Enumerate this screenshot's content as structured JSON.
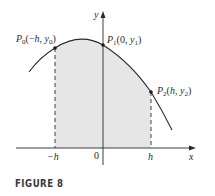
{
  "figure": {
    "caption": "FIGURE 8",
    "axes": {
      "x_label": "x",
      "y_label": "y",
      "origin_label": "0",
      "x_ticks": [
        "−h",
        "h"
      ]
    },
    "points": [
      {
        "name": "P0",
        "main": "P",
        "sub": "0",
        "coords_open": "(−",
        "h": "h",
        "comma": ", ",
        "yvar": "y",
        "ysub": "0",
        "close": ")"
      },
      {
        "name": "P1",
        "main": "P",
        "sub": "1",
        "coords_open": "(0, ",
        "yvar": "y",
        "ysub": "1",
        "close": ")"
      },
      {
        "name": "P2",
        "main": "P",
        "sub": "2",
        "coords_open": "(",
        "h": "h",
        "comma": ", ",
        "yvar": "y",
        "ysub": "2",
        "close": ")"
      }
    ],
    "colors": {
      "shade": "#e6e6e6",
      "stroke": "#2a2a2a",
      "caption": "#3a3a3a"
    }
  }
}
